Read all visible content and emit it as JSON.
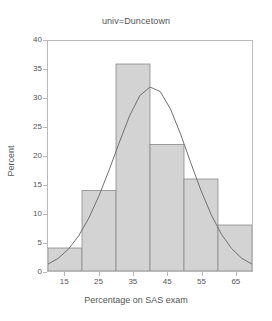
{
  "chart_data": {
    "type": "bar",
    "title": "univ=Duncetown",
    "xlabel": "Percentage on SAS exam",
    "ylabel": "Percent",
    "categories": [
      "10-20",
      "20-30",
      "30-40",
      "40-50",
      "50-60",
      "60-70"
    ],
    "bin_edges": [
      10,
      20,
      30,
      40,
      50,
      60,
      70
    ],
    "values": [
      4,
      14,
      36,
      22,
      16,
      8
    ],
    "xlim": [
      10,
      70
    ],
    "ylim": [
      0,
      40
    ],
    "xticks": [
      15,
      25,
      35,
      45,
      55,
      65
    ],
    "xtick_labels": [
      "15",
      "25",
      "35",
      "45",
      "55",
      "65"
    ],
    "yticks": [
      0,
      5,
      10,
      15,
      20,
      25,
      30,
      35,
      40
    ],
    "ytick_labels": [
      "0",
      "5",
      "10",
      "15",
      "20",
      "25",
      "30",
      "35",
      "40"
    ],
    "grid": false,
    "legend": false,
    "overlay": {
      "type": "line",
      "name": "normal density curve",
      "peak_x": 40,
      "peak_y": 32,
      "x": [
        10,
        13,
        16,
        19,
        22,
        25,
        28,
        31,
        34,
        37,
        40,
        43,
        46,
        49,
        52,
        55,
        58,
        61,
        64,
        67,
        70
      ],
      "y": [
        1.2,
        2.2,
        3.8,
        6.1,
        9.2,
        13.1,
        17.6,
        22.4,
        27.0,
        30.5,
        32.0,
        31.2,
        28.2,
        23.8,
        18.8,
        14.0,
        9.8,
        6.4,
        3.9,
        2.2,
        1.2
      ]
    },
    "colors": {
      "bar_fill": "#d3d3d3",
      "bar_edge": "#8a8a8a",
      "curve": "#6e6e6e",
      "frame": "#b9b9b9",
      "text": "#555555",
      "background": "#ffffff"
    }
  }
}
